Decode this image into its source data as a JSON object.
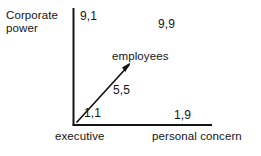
{
  "diagram": {
    "background_color": "#ffffff",
    "line_color": "#141414",
    "axes": {
      "y": {
        "title": "Corporate power",
        "orientation": "vertical"
      },
      "x": {
        "left_title": "executive",
        "right_title": "personal concern",
        "orientation": "horizontal"
      }
    },
    "grid_points": [
      {
        "name": "top-left",
        "label": "9,1"
      },
      {
        "name": "top-right",
        "label": "9,9"
      },
      {
        "name": "bottom-left",
        "label": "1,1"
      },
      {
        "name": "bottom-right",
        "label": "1,9"
      },
      {
        "name": "center",
        "label": "5,5"
      }
    ],
    "arrow": {
      "label": "employees",
      "direction": "diagonal-up-right"
    }
  }
}
